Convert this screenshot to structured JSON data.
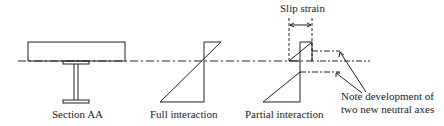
{
  "diagram": {
    "labels": {
      "section": "Section AA",
      "full": "Full interaction",
      "partial": "Partial interaction",
      "slip": "Slip strain",
      "note_line1": "Note development of",
      "note_line2": "two new neutral axes"
    },
    "colors": {
      "stroke": "#222222",
      "background": "#ffffff"
    }
  }
}
